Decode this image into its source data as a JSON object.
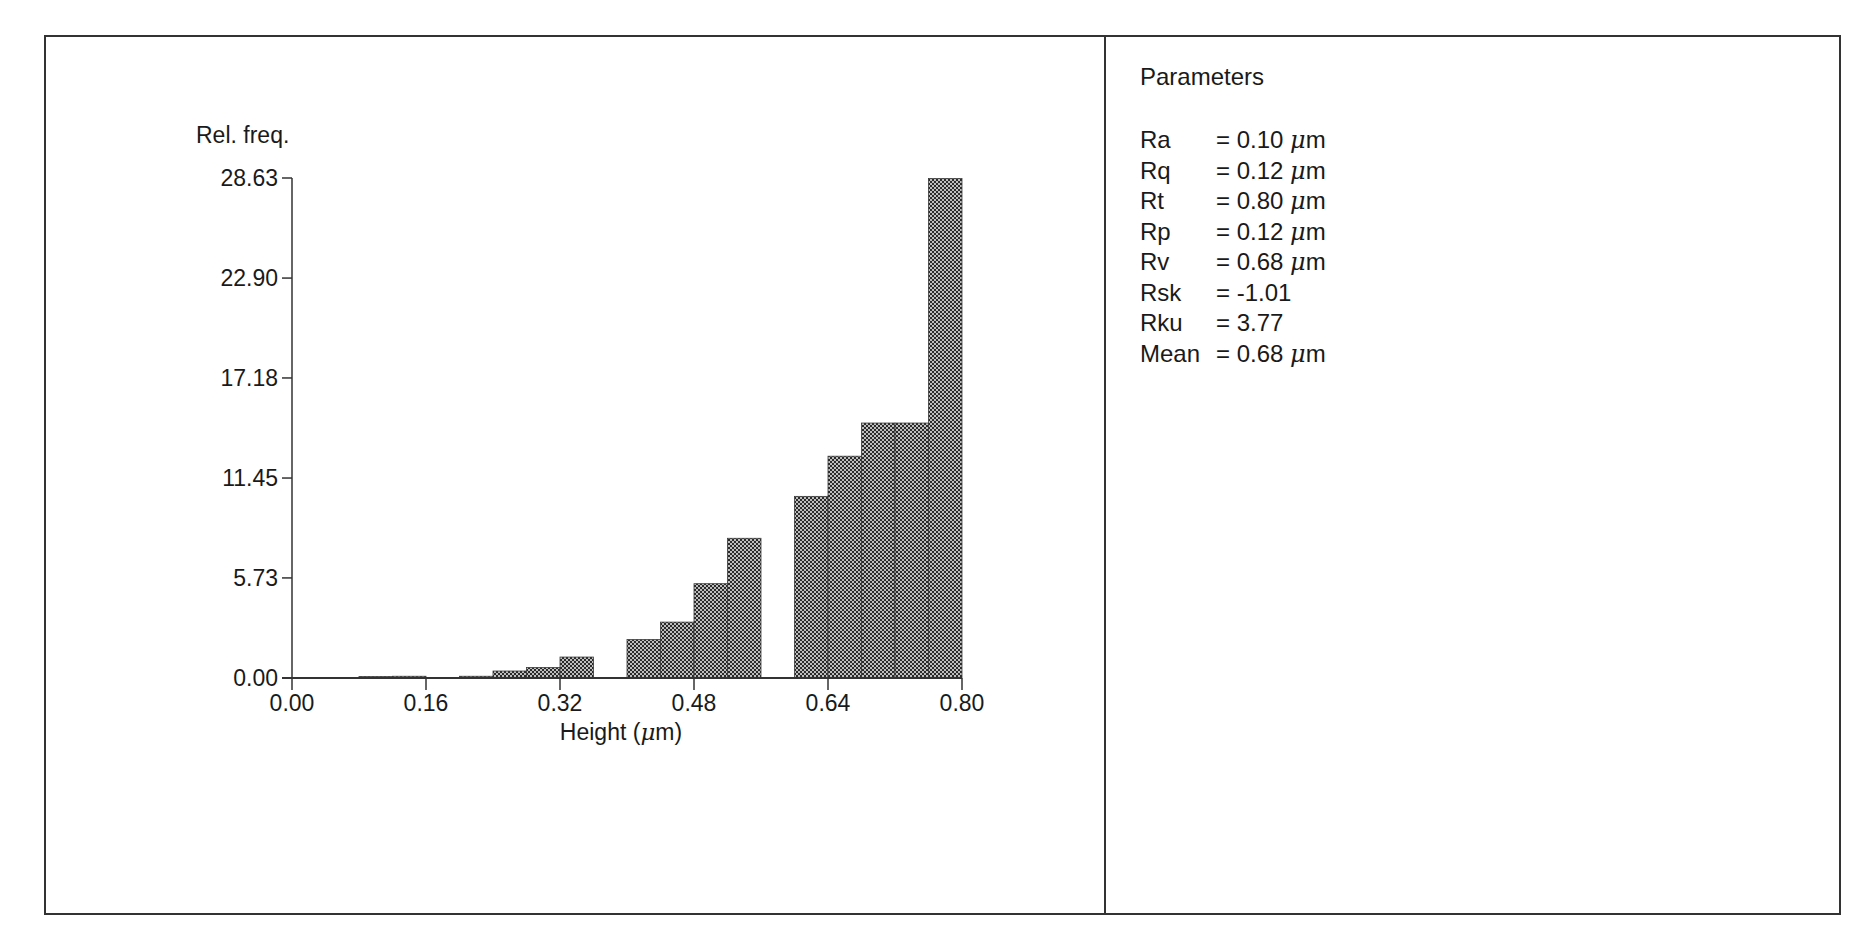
{
  "chart_data": {
    "type": "bar",
    "title": "",
    "xlabel": "Height (μm)",
    "ylabel": "Rel. freq.",
    "xlim": [
      0.0,
      0.8
    ],
    "ylim": [
      0.0,
      28.63
    ],
    "x_ticks": [
      "0.00",
      "0.16",
      "0.32",
      "0.48",
      "0.64",
      "0.80"
    ],
    "y_ticks": [
      "0.00",
      "5.73",
      "11.45",
      "17.18",
      "22.90",
      "28.63"
    ],
    "bin_width": 0.04,
    "categories": [
      "0.00-0.04",
      "0.04-0.08",
      "0.08-0.12",
      "0.12-0.16",
      "0.16-0.20",
      "0.20-0.24",
      "0.24-0.28",
      "0.28-0.32",
      "0.32-0.36",
      "0.36-0.40",
      "0.40-0.44",
      "0.44-0.48",
      "0.48-0.52",
      "0.52-0.56",
      "0.56-0.60",
      "0.60-0.64",
      "0.64-0.68",
      "0.68-0.72",
      "0.72-0.76",
      "0.76-0.80"
    ],
    "bin_starts": [
      0.0,
      0.04,
      0.08,
      0.12,
      0.16,
      0.2,
      0.24,
      0.28,
      0.32,
      0.36,
      0.4,
      0.44,
      0.48,
      0.52,
      0.56,
      0.6,
      0.64,
      0.68,
      0.72,
      0.76
    ],
    "values": [
      0.0,
      0.0,
      0.05,
      0.1,
      0.0,
      0.1,
      0.4,
      0.6,
      1.2,
      0.0,
      2.2,
      3.2,
      5.4,
      8.0,
      0.0,
      10.4,
      12.7,
      14.6,
      14.6,
      28.6
    ],
    "grid": false,
    "legend": null
  },
  "chart": {
    "ylabel": "Rel. freq.",
    "xlabel_prefix": "Height (",
    "xlabel_unit": "μ",
    "xlabel_suffix": "m)",
    "bar_color": "#555555"
  },
  "parameters": {
    "title": "Parameters",
    "rows": [
      {
        "name": "Ra",
        "value": "= 0.10",
        "unit": "μm"
      },
      {
        "name": "Rq",
        "value": "= 0.12",
        "unit": "μm"
      },
      {
        "name": "Rt",
        "value": "= 0.80",
        "unit": "μm"
      },
      {
        "name": "Rp",
        "value": "= 0.12",
        "unit": "μm"
      },
      {
        "name": "Rv",
        "value": "= 0.68",
        "unit": "μm"
      },
      {
        "name": "Rsk",
        "value": "= -1.01",
        "unit": ""
      },
      {
        "name": "Rku",
        "value": "= 3.77",
        "unit": ""
      },
      {
        "name": "Mean",
        "value": "= 0.68",
        "unit": "μm"
      }
    ]
  }
}
